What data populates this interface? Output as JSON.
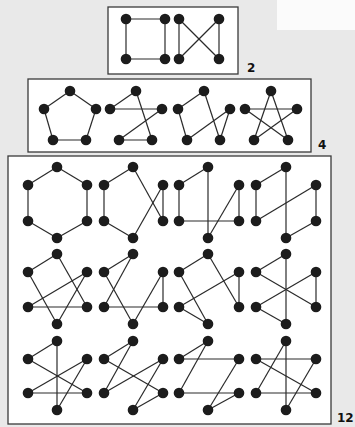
{
  "colors": {
    "background": "#e9e9e9",
    "panel": "#ffffff",
    "node": "#1c1c1c",
    "edge": "#2a2a2a"
  },
  "groups": [
    {
      "id": "n4",
      "count_label": "2",
      "box": {
        "x": 108,
        "y": 7,
        "w": 130,
        "h": 67
      },
      "label_pos": {
        "x": 247,
        "y": 61
      },
      "graphs": [
        {
          "name": "4-cycle square",
          "nodes": [
            [
              126,
              19
            ],
            [
              165,
              19
            ],
            [
              126,
              59
            ],
            [
              165,
              59
            ]
          ],
          "edges": [
            [
              0,
              1
            ],
            [
              1,
              3
            ],
            [
              3,
              2
            ],
            [
              2,
              0
            ]
          ]
        },
        {
          "name": "4-cycle bowtie",
          "nodes": [
            [
              179,
              19
            ],
            [
              219,
              19
            ],
            [
              179,
              59
            ],
            [
              219,
              59
            ]
          ],
          "edges": [
            [
              0,
              2
            ],
            [
              1,
              3
            ],
            [
              0,
              3
            ],
            [
              1,
              2
            ]
          ]
        }
      ]
    },
    {
      "id": "n5",
      "count_label": "4",
      "box": {
        "x": 28,
        "y": 79,
        "w": 283,
        "h": 73
      },
      "label_pos": {
        "x": 318,
        "y": 138
      },
      "graphs": [
        {
          "name": "pentagon",
          "nodes": [
            [
              70,
              91
            ],
            [
              44,
              109
            ],
            [
              96,
              109
            ],
            [
              53,
              140
            ],
            [
              86,
              140
            ]
          ],
          "edges": [
            [
              0,
              1
            ],
            [
              0,
              2
            ],
            [
              1,
              3
            ],
            [
              2,
              4
            ],
            [
              3,
              4
            ]
          ]
        },
        {
          "name": "pentagon variant 2",
          "nodes": [
            [
              136,
              91
            ],
            [
              110,
              109
            ],
            [
              162,
              109
            ],
            [
              119,
              140
            ],
            [
              152,
              140
            ]
          ],
          "edges": [
            [
              0,
              1
            ],
            [
              1,
              2
            ],
            [
              2,
              3
            ],
            [
              3,
              4
            ],
            [
              4,
              0
            ]
          ]
        },
        {
          "name": "pentagon variant 3",
          "nodes": [
            [
              204,
              91
            ],
            [
              178,
              109
            ],
            [
              230,
              109
            ],
            [
              187,
              140
            ],
            [
              220,
              140
            ]
          ],
          "edges": [
            [
              0,
              1
            ],
            [
              1,
              3
            ],
            [
              3,
              2
            ],
            [
              2,
              4
            ],
            [
              4,
              0
            ]
          ]
        },
        {
          "name": "pentagram",
          "nodes": [
            [
              271,
              91
            ],
            [
              245,
              109
            ],
            [
              297,
              109
            ],
            [
              254,
              140
            ],
            [
              288,
              140
            ]
          ],
          "edges": [
            [
              0,
              3
            ],
            [
              0,
              4
            ],
            [
              1,
              2
            ],
            [
              1,
              4
            ],
            [
              2,
              3
            ]
          ]
        }
      ]
    },
    {
      "id": "n6",
      "count_label": "12",
      "box": {
        "x": 8,
        "y": 156,
        "w": 323,
        "h": 268
      },
      "label_pos": {
        "x": 339,
        "y": 411
      },
      "graphs": [
        {
          "name": "hexagon",
          "nodes": [
            [
              57,
              167
            ],
            [
              28,
              185
            ],
            [
              87,
              185
            ],
            [
              28,
              221
            ],
            [
              87,
              221
            ],
            [
              57,
              238
            ]
          ],
          "edges": [
            [
              0,
              1
            ],
            [
              0,
              2
            ],
            [
              1,
              3
            ],
            [
              2,
              4
            ],
            [
              3,
              5
            ],
            [
              4,
              5
            ]
          ]
        },
        {
          "name": "hex variant 2",
          "nodes": [
            [
              133,
              167
            ],
            [
              104,
              185
            ],
            [
              163,
              185
            ],
            [
              104,
              221
            ],
            [
              163,
              221
            ],
            [
              133,
              238
            ]
          ],
          "edges": [
            [
              0,
              1
            ],
            [
              1,
              3
            ],
            [
              3,
              5
            ],
            [
              5,
              2
            ],
            [
              2,
              4
            ],
            [
              4,
              0
            ]
          ]
        },
        {
          "name": "hex variant 3",
          "nodes": [
            [
              208,
              167
            ],
            [
              179,
              185
            ],
            [
              239,
              185
            ],
            [
              179,
              221
            ],
            [
              239,
              221
            ],
            [
              208,
              238
            ]
          ],
          "edges": [
            [
              0,
              1
            ],
            [
              1,
              3
            ],
            [
              3,
              4
            ],
            [
              4,
              2
            ],
            [
              2,
              5
            ],
            [
              5,
              0
            ]
          ]
        },
        {
          "name": "hex variant 4",
          "nodes": [
            [
              286,
              167
            ],
            [
              256,
              185
            ],
            [
              316,
              185
            ],
            [
              256,
              221
            ],
            [
              316,
              221
            ],
            [
              286,
              238
            ]
          ],
          "edges": [
            [
              0,
              1
            ],
            [
              1,
              3
            ],
            [
              3,
              2
            ],
            [
              2,
              4
            ],
            [
              4,
              5
            ],
            [
              5,
              0
            ]
          ]
        },
        {
          "name": "hex variant 5",
          "nodes": [
            [
              57,
              254
            ],
            [
              28,
              272
            ],
            [
              87,
              272
            ],
            [
              28,
              307
            ],
            [
              87,
              307
            ],
            [
              57,
              324
            ]
          ],
          "edges": [
            [
              0,
              1
            ],
            [
              0,
              4
            ],
            [
              1,
              5
            ],
            [
              2,
              3
            ],
            [
              2,
              5
            ],
            [
              3,
              4
            ]
          ]
        },
        {
          "name": "hex variant 6",
          "nodes": [
            [
              133,
              254
            ],
            [
              104,
              272
            ],
            [
              163,
              272
            ],
            [
              104,
              307
            ],
            [
              163,
              307
            ],
            [
              133,
              324
            ]
          ],
          "edges": [
            [
              0,
              1
            ],
            [
              0,
              3
            ],
            [
              1,
              5
            ],
            [
              3,
              4
            ],
            [
              4,
              2
            ],
            [
              2,
              5
            ]
          ]
        },
        {
          "name": "hex variant 7",
          "nodes": [
            [
              208,
              254
            ],
            [
              179,
              272
            ],
            [
              239,
              272
            ],
            [
              179,
              307
            ],
            [
              239,
              307
            ],
            [
              208,
              324
            ]
          ],
          "edges": [
            [
              0,
              1
            ],
            [
              0,
              4
            ],
            [
              4,
              2
            ],
            [
              2,
              3
            ],
            [
              3,
              5
            ],
            [
              5,
              1
            ]
          ]
        },
        {
          "name": "hex variant 8",
          "nodes": [
            [
              286,
              254
            ],
            [
              256,
              272
            ],
            [
              316,
              272
            ],
            [
              256,
              307
            ],
            [
              316,
              307
            ],
            [
              286,
              324
            ]
          ],
          "edges": [
            [
              0,
              1
            ],
            [
              0,
              5
            ],
            [
              1,
              4
            ],
            [
              4,
              2
            ],
            [
              2,
              3
            ],
            [
              3,
              5
            ]
          ]
        },
        {
          "name": "hex variant 9",
          "nodes": [
            [
              57,
              341
            ],
            [
              28,
              359
            ],
            [
              87,
              359
            ],
            [
              28,
              393
            ],
            [
              87,
              393
            ],
            [
              57,
              410
            ]
          ],
          "edges": [
            [
              0,
              1
            ],
            [
              0,
              5
            ],
            [
              1,
              4
            ],
            [
              4,
              3
            ],
            [
              3,
              2
            ],
            [
              2,
              5
            ]
          ]
        },
        {
          "name": "hex variant 10",
          "nodes": [
            [
              133,
              341
            ],
            [
              104,
              359
            ],
            [
              163,
              359
            ],
            [
              104,
              393
            ],
            [
              163,
              393
            ],
            [
              133,
              410
            ]
          ],
          "edges": [
            [
              0,
              1
            ],
            [
              0,
              3
            ],
            [
              3,
              2
            ],
            [
              2,
              5
            ],
            [
              5,
              4
            ],
            [
              4,
              1
            ]
          ]
        },
        {
          "name": "hex variant 11",
          "nodes": [
            [
              208,
              341
            ],
            [
              179,
              359
            ],
            [
              239,
              359
            ],
            [
              179,
              393
            ],
            [
              239,
              393
            ],
            [
              208,
              410
            ]
          ],
          "edges": [
            [
              0,
              1
            ],
            [
              0,
              3
            ],
            [
              1,
              2
            ],
            [
              2,
              5
            ],
            [
              5,
              4
            ],
            [
              4,
              3
            ]
          ]
        },
        {
          "name": "hex variant 12",
          "nodes": [
            [
              286,
              341
            ],
            [
              256,
              359
            ],
            [
              316,
              359
            ],
            [
              256,
              393
            ],
            [
              316,
              393
            ],
            [
              286,
              410
            ]
          ],
          "edges": [
            [
              0,
              3
            ],
            [
              0,
              5
            ],
            [
              1,
              2
            ],
            [
              1,
              4
            ],
            [
              3,
              4
            ],
            [
              2,
              5
            ]
          ]
        }
      ]
    }
  ]
}
